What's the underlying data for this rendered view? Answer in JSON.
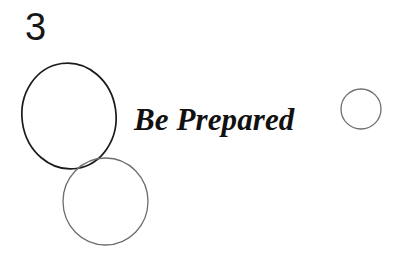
{
  "slide": {
    "number": "3",
    "headline": "Be Prepared",
    "background_color": "#ffffff"
  },
  "shapes": {
    "large_ellipse": {
      "name": "large-black-ellipse",
      "cx": 69,
      "cy": 116,
      "rx": 47,
      "ry": 53,
      "rotation": -8,
      "stroke_color": "#1b1b1b",
      "stroke_width": 1.7,
      "fill": "none"
    },
    "medium_circle": {
      "name": "medium-gray-circle",
      "cx": 105.5,
      "cy": 201.5,
      "rx": 42.5,
      "ry": 43.5,
      "rotation": 0,
      "stroke_color": "#6d6d72",
      "stroke_width": 1.3,
      "fill": "none"
    },
    "small_circle": {
      "name": "small-gray-circle",
      "cx": 361,
      "cy": 109,
      "rx": 20,
      "ry": 20,
      "rotation": 0,
      "stroke_color": "#6d6d72",
      "stroke_width": 1.3,
      "fill": "none"
    }
  }
}
